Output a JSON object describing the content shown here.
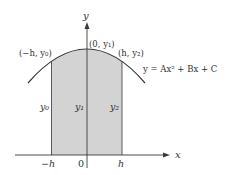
{
  "diagram": {
    "type": "parabola-area-simpson",
    "colors": {
      "curve": "#3a3a3a",
      "axis": "#3a3a3a",
      "shade": "#d3d3d3",
      "text": "#333333"
    },
    "axes": {
      "x_label": "x",
      "y_label": "y"
    },
    "ticks": {
      "neg_h": "−h",
      "zero": "0",
      "pos_h": "h"
    },
    "points": {
      "left": "(−h, y₀)",
      "center": "(0, y₁)",
      "right": "(h, y₂)"
    },
    "heights": {
      "y0": "y₀",
      "y1": "y₁",
      "y2": "y₂"
    },
    "equation": "y = Ax² + Bx + C"
  }
}
